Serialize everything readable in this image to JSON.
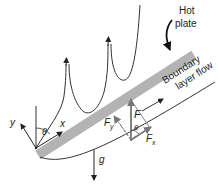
{
  "diagram": {
    "title_label_line1": "Hot",
    "title_label_line2": "plate",
    "flow_label_line1": "Boundary",
    "flow_label_line2": "layer flow",
    "axis_x": "x",
    "axis_y": "y",
    "angle": "θ",
    "force": "F",
    "force_x": "F",
    "force_x_sub": "x",
    "force_y": "F",
    "force_y_sub": "y",
    "force_angle": "θ",
    "gravity": "g",
    "colors": {
      "plate": "#b3b3b3",
      "line": "#333333",
      "force_vector": "#7a7a7a"
    }
  }
}
